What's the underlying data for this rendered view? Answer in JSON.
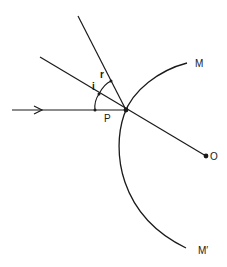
{
  "diagram": {
    "title": "",
    "labels": {
      "mirror_top": "M",
      "mirror_bottom": "M′",
      "centre": "O",
      "point": "P",
      "angle_incidence": "i",
      "angle_reflection": "r"
    },
    "elements": [
      {
        "id": "incident-ray",
        "type": "ray",
        "direction": "left-to-right",
        "arrow": true
      },
      {
        "id": "normal",
        "type": "line",
        "from": "P",
        "to": "O"
      },
      {
        "id": "reflected-ray",
        "type": "ray"
      },
      {
        "id": "mirror",
        "type": "arc",
        "ends": [
          "M",
          "M′"
        ]
      },
      {
        "id": "angle-i",
        "type": "angle-arc",
        "between": [
          "incident-ray",
          "normal"
        ]
      },
      {
        "id": "angle-r",
        "type": "angle-arc",
        "between": [
          "normal",
          "reflected-ray"
        ]
      }
    ],
    "colors": {
      "ink": "#1a1a1a",
      "background": "#ffffff"
    }
  }
}
